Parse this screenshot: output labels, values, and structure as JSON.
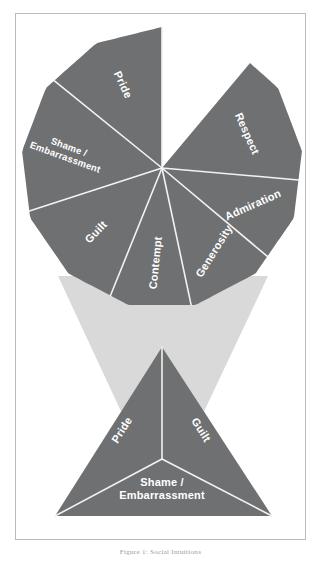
{
  "figure": {
    "caption": "Figure 1: Social Intuitions",
    "colors": {
      "sector_fill": "#6e7072",
      "funnel_fill": "#d9d9d9",
      "divider": "#f2f2f2",
      "label_text": "#ffffff",
      "frame_border": "#b9bbbd",
      "background": "#ffffff"
    },
    "wheel": {
      "name": "emotion-wheel",
      "center_x": 162,
      "center_y": 168,
      "radius": 141,
      "sides": 13,
      "sectors": [
        {
          "label": "Pride",
          "start_angle": -90,
          "end_angle": -141,
          "label_angle": -115,
          "label_radius": 92,
          "text_rotation": 65,
          "lines": [
            "Pride"
          ]
        },
        {
          "label": "Shame / Embarrassment",
          "start_angle": -141,
          "end_angle": -198,
          "label_angle": -170,
          "label_radius": 96,
          "text_rotation": 20,
          "lines": [
            "Shame /",
            "Embarrassment"
          ]
        },
        {
          "label": "Guilt",
          "start_angle": -198,
          "end_angle": -248,
          "label_angle": -224,
          "label_radius": 92,
          "text_rotation": -46,
          "lines": [
            "Guilt"
          ]
        },
        {
          "label": "Contempt",
          "start_angle": -248,
          "end_angle": -282,
          "label_angle": -266,
          "label_radius": 95,
          "text_rotation": -84,
          "lines": [
            "Contempt"
          ]
        },
        {
          "label": "Generosity",
          "start_angle": -282,
          "end_angle": -320,
          "label_angle": -302,
          "label_radius": 98,
          "text_rotation": -58,
          "lines": [
            "Generosity"
          ]
        },
        {
          "label": "Admiration",
          "start_angle": -320,
          "end_angle": -355,
          "label_angle": -338,
          "label_radius": 98,
          "text_rotation": -24,
          "lines": [
            "Admiration"
          ]
        },
        {
          "label": "Respect",
          "start_angle": -355,
          "end_angle": -410,
          "label_angle": -382,
          "label_radius": 92,
          "text_rotation": 66,
          "lines": [
            "Respect"
          ]
        }
      ]
    },
    "funnel": {
      "name": "connector-funnel",
      "top_left_x": 58,
      "top_right_x": 268,
      "top_y": 276,
      "bottom_left_x": 125,
      "bottom_right_x": 200,
      "bottom_y": 420
    },
    "triangle": {
      "name": "emotion-triangle",
      "apex_x": 162,
      "apex_y": 347,
      "base_left_x": 55,
      "base_right_x": 272,
      "base_y": 516,
      "center_x": 162,
      "center_y": 459,
      "sectors": [
        {
          "label": "Pride",
          "label_x": 122,
          "label_y": 430,
          "text_rotation": -58,
          "lines": [
            "Pride"
          ]
        },
        {
          "label": "Guilt",
          "label_x": 201,
          "label_y": 430,
          "text_rotation": 58,
          "lines": [
            "Guilt"
          ]
        },
        {
          "label": "Shame / Embarrassment",
          "label_x": 162,
          "label_y": 482,
          "text_rotation": 0,
          "lines": [
            "Shame /",
            "Embarrassment"
          ]
        }
      ]
    }
  }
}
